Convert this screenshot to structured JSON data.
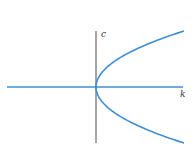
{
  "figure": {
    "axis_color": "#4a4a4a",
    "curve_color": "#3f8fd2",
    "h_axis_color": "#3f8fd2"
  },
  "chart_data": {
    "type": "line",
    "title": "",
    "xlabel": "k",
    "ylabel": "c",
    "grid": false,
    "legend": null,
    "series": [
      {
        "name": "k = c^2",
        "points": [
          {
            "k": 0,
            "c": 0
          },
          {
            "k": 0.25,
            "c": 0.5
          },
          {
            "k": 0.25,
            "c": -0.5
          },
          {
            "k": 1,
            "c": 1
          },
          {
            "k": 1,
            "c": -1
          },
          {
            "k": 2.25,
            "c": 1.5
          },
          {
            "k": 2.25,
            "c": -1.5
          },
          {
            "k": 4,
            "c": 2
          },
          {
            "k": 4,
            "c": -2
          }
        ]
      }
    ],
    "xlim": [
      -4,
      4
    ],
    "ylim": [
      -2,
      2
    ]
  },
  "labels": {
    "c_axis": "c",
    "k_axis": "k"
  }
}
